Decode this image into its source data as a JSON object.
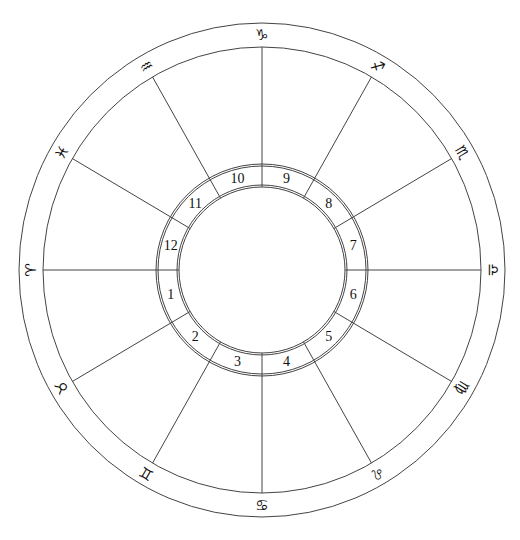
{
  "chart": {
    "type": "natal-chart-wheel",
    "center": [
      262,
      270
    ],
    "outer_ring": {
      "rx": 243,
      "ry": 247
    },
    "zodiac_inner_ring": {
      "rx": 219,
      "ry": 223
    },
    "house_outer_ring": {
      "r1": 106,
      "r2": 104
    },
    "house_inner_ring": {
      "r1": 85,
      "r2": 83
    },
    "line_color": "#444444",
    "text_color": "#111111",
    "zodiac_signs": [
      {
        "name": "capricorn",
        "glyph": "♑",
        "angle": 90
      },
      {
        "name": "sagittarius",
        "glyph": "♐",
        "angle": 60
      },
      {
        "name": "scorpio",
        "glyph": "♏",
        "angle": 30
      },
      {
        "name": "libra",
        "glyph": "♎",
        "angle": 0
      },
      {
        "name": "virgo",
        "glyph": "♍",
        "angle": -30
      },
      {
        "name": "leo",
        "glyph": "♌",
        "angle": -60
      },
      {
        "name": "cancer",
        "glyph": "♋",
        "angle": -90
      },
      {
        "name": "gemini",
        "glyph": "♊",
        "angle": -120
      },
      {
        "name": "taurus",
        "glyph": "♉",
        "angle": -150
      },
      {
        "name": "aries",
        "glyph": "♈",
        "angle": 180
      },
      {
        "name": "pisces",
        "glyph": "♓",
        "angle": 150
      },
      {
        "name": "aquarius",
        "glyph": "♒",
        "angle": 120
      }
    ],
    "houses": [
      {
        "number": "1",
        "angle": 195
      },
      {
        "number": "2",
        "angle": 225
      },
      {
        "number": "3",
        "angle": 255
      },
      {
        "number": "4",
        "angle": 285
      },
      {
        "number": "5",
        "angle": 315
      },
      {
        "number": "6",
        "angle": 345
      },
      {
        "number": "7",
        "angle": 15
      },
      {
        "number": "8",
        "angle": 45
      },
      {
        "number": "9",
        "angle": 75
      },
      {
        "number": "10",
        "angle": 105
      },
      {
        "number": "11",
        "angle": 135
      },
      {
        "number": "12",
        "angle": 165
      }
    ]
  }
}
